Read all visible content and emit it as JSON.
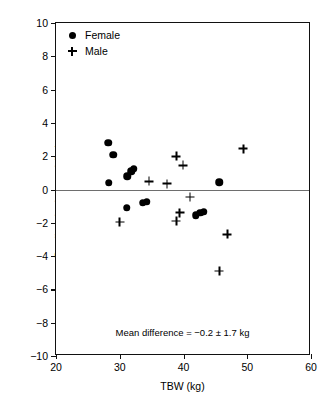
{
  "chart_data": {
    "type": "scatter",
    "title": "",
    "xlabel": "TBW (kg)",
    "ylabel": "Predicted–observed (kg)",
    "xlim": [
      20,
      60
    ],
    "ylim": [
      -10,
      10
    ],
    "xticks": [
      20,
      30,
      40,
      50,
      60
    ],
    "yticks": [
      10,
      8,
      6,
      4,
      2,
      0,
      -2,
      -4,
      -6,
      -8,
      -10
    ],
    "grid": false,
    "reference_line": {
      "y": 0,
      "color": "#6e6e6e"
    },
    "legend": {
      "position": "top-left",
      "entries": [
        {
          "label": "Female",
          "marker": "filled-circle",
          "color": "#000000"
        },
        {
          "label": "Male",
          "marker": "plus",
          "color": "#000000"
        }
      ]
    },
    "annotation": "Mean difference = −0.2 ± 1.7 kg",
    "annotation_position": {
      "x": 40,
      "y": -8.6
    },
    "series": [
      {
        "name": "Female",
        "marker": "filled-circle",
        "points": [
          {
            "x": 28.2,
            "y": 2.8
          },
          {
            "x": 29.0,
            "y": 2.1
          },
          {
            "x": 28.3,
            "y": 0.4
          },
          {
            "x": 31.2,
            "y": 0.8
          },
          {
            "x": 31.8,
            "y": 1.1
          },
          {
            "x": 32.2,
            "y": 1.25
          },
          {
            "x": 31.1,
            "y": -1.1
          },
          {
            "x": 33.6,
            "y": -0.8
          },
          {
            "x": 34.2,
            "y": -0.75
          },
          {
            "x": 41.9,
            "y": -1.55
          },
          {
            "x": 42.6,
            "y": -1.4
          },
          {
            "x": 43.2,
            "y": -1.35
          },
          {
            "x": 45.6,
            "y": 0.45
          }
        ]
      },
      {
        "name": "Male",
        "marker": "plus",
        "points": [
          {
            "x": 30.0,
            "y": -1.95
          },
          {
            "x": 34.6,
            "y": 0.5
          },
          {
            "x": 37.4,
            "y": 0.35
          },
          {
            "x": 38.9,
            "y": 2.0
          },
          {
            "x": 39.9,
            "y": 1.45
          },
          {
            "x": 39.4,
            "y": -1.4
          },
          {
            "x": 38.9,
            "y": -1.9
          },
          {
            "x": 41.0,
            "y": -0.45
          },
          {
            "x": 46.9,
            "y": -2.7
          },
          {
            "x": 45.6,
            "y": -4.9
          },
          {
            "x": 49.4,
            "y": 2.45
          }
        ]
      }
    ]
  }
}
